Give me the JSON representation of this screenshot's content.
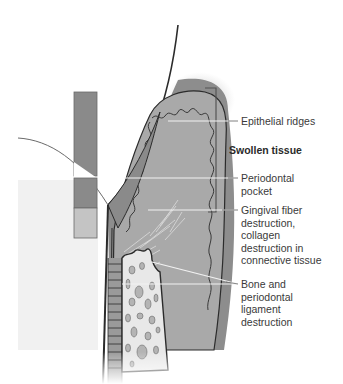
{
  "diagram": {
    "colors": {
      "gingiva_dark": "#8a8a8a",
      "gingiva_mid": "#a6a6a6",
      "gingiva_light": "#bdbdbd",
      "bone": "#e6e6e6",
      "outline": "#2b2b2b",
      "leader_line": "#f2f2f2",
      "bracket": "#555555",
      "text": "#3a3a3a"
    },
    "labels": {
      "epithelial_ridges": "Epithelial ridges",
      "swollen_tissue": "Swollen tissue",
      "periodontal_pocket_1": "Periodontal",
      "periodontal_pocket_2": "pocket",
      "gingival_1": "Gingival fiber",
      "gingival_2": "destruction,",
      "gingival_3": "collagen",
      "gingival_4": "destruction in",
      "gingival_5": "connective tissue",
      "bone_1": "Bone and",
      "bone_2": "periodontal",
      "bone_3": "ligament",
      "bone_4": "destruction"
    },
    "probe_segments": [
      "dark",
      "white",
      "dark",
      "light"
    ]
  }
}
